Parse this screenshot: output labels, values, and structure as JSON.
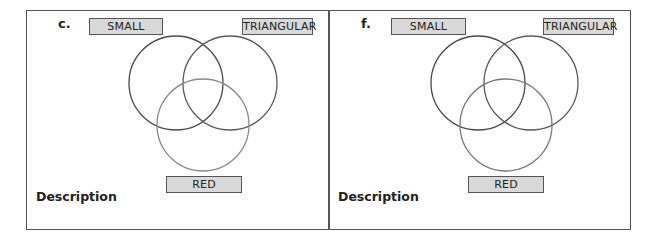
{
  "panels": [
    {
      "letter": "c.",
      "labels": {
        "set1": "SMALL",
        "set2": "TRIANGULAR",
        "set3": "RED"
      },
      "description_label": "Description"
    },
    {
      "letter": "f.",
      "labels": {
        "set1": "SMALL",
        "set2": "TRIANGULAR",
        "set3": "RED"
      },
      "description_label": "Description"
    }
  ],
  "colors": {
    "border": "#555555",
    "label_fill": "#d9d9d9",
    "circle_dark": "#4a4a4a",
    "circle_light": "#8a8a8a"
  }
}
